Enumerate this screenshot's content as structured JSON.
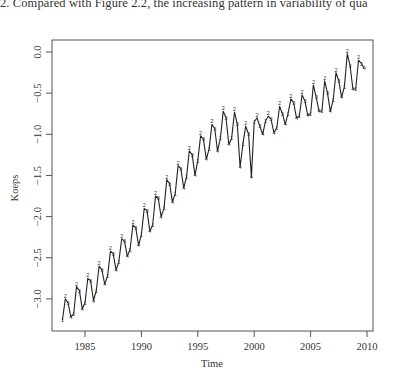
{
  "page": {
    "caption_fragment": "2. Compared with Figure 2.2, the increasing pattern in variability of qua"
  },
  "chart_data": {
    "type": "line",
    "title": "",
    "xlabel": "Time",
    "ylabel": "Koeps",
    "xlim": [
      1983,
      2010
    ],
    "ylim": [
      -3.3,
      0.1
    ],
    "x_ticks": [
      1985,
      1990,
      1995,
      2000,
      2005,
      2010
    ],
    "x_tick_labels": [
      "1985",
      "1990",
      "1995",
      "2000",
      "2005",
      "2010"
    ],
    "y_ticks": [
      0.0,
      -0.5,
      -1.0,
      -1.5,
      -2.0,
      -2.5,
      -3.0
    ],
    "y_tick_labels": [
      "0.0",
      "-0.5",
      "-1.0",
      "-1.5",
      "-2.0",
      "-2.5",
      "-3.0"
    ],
    "grid": false,
    "legend": null,
    "frequency": "quarterly",
    "point_labels": "quarter number (1-4)",
    "start": 1983.0,
    "series": [
      {
        "name": "Koeps",
        "values": [
          -3.26,
          -3.0,
          -3.05,
          -3.22,
          -3.18,
          -2.85,
          -2.9,
          -3.12,
          -3.05,
          -2.75,
          -2.78,
          -3.02,
          -2.9,
          -2.6,
          -2.65,
          -2.82,
          -2.72,
          -2.42,
          -2.45,
          -2.65,
          -2.55,
          -2.27,
          -2.3,
          -2.48,
          -2.4,
          -2.1,
          -2.14,
          -2.35,
          -2.22,
          -1.9,
          -1.93,
          -2.18,
          -2.1,
          -1.75,
          -1.78,
          -2.0,
          -1.9,
          -1.55,
          -1.6,
          -1.82,
          -1.72,
          -1.38,
          -1.42,
          -1.65,
          -1.52,
          -1.2,
          -1.25,
          -1.5,
          -1.32,
          -1.02,
          -1.06,
          -1.3,
          -1.18,
          -0.88,
          -0.93,
          -1.2,
          -1.05,
          -0.72,
          -0.8,
          -1.12,
          -1.05,
          -0.73,
          -0.88,
          -1.4,
          -1.12,
          -0.9,
          -1.0,
          -1.52,
          -0.85,
          -0.8,
          -0.9,
          -1.0,
          -0.84,
          -0.78,
          -0.82,
          -0.98,
          -0.92,
          -0.66,
          -0.75,
          -0.88,
          -0.75,
          -0.57,
          -0.62,
          -0.8,
          -0.78,
          -0.52,
          -0.6,
          -0.77,
          -0.75,
          -0.4,
          -0.55,
          -0.72,
          -0.72,
          -0.35,
          -0.5,
          -0.72,
          -0.58,
          -0.25,
          -0.35,
          -0.55,
          -0.42,
          -0.02,
          -0.17,
          -0.45,
          -0.45,
          -0.1,
          -0.14,
          -0.2
        ]
      }
    ]
  }
}
